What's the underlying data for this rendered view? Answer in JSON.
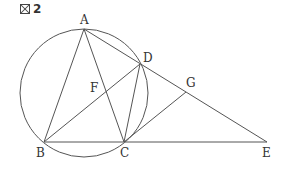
{
  "figure": {
    "title_number": "2",
    "title_icon": "figure-mark-icon"
  },
  "geometry": {
    "circle": {
      "cx": 84,
      "cy": 93,
      "r": 64
    },
    "points": {
      "A": {
        "x": 84,
        "y": 29,
        "label": "A",
        "lx": 80,
        "ly": 24
      },
      "B": {
        "x": 44,
        "y": 142,
        "label": "B",
        "lx": 36,
        "ly": 157
      },
      "C": {
        "x": 124,
        "y": 142,
        "label": "C",
        "lx": 120,
        "ly": 157
      },
      "D": {
        "x": 140,
        "y": 64,
        "label": "D",
        "lx": 143,
        "ly": 62
      },
      "E": {
        "x": 267,
        "y": 142,
        "label": "E",
        "lx": 262,
        "ly": 157
      },
      "F": {
        "x": 102,
        "y": 97,
        "label": "F",
        "lx": 90,
        "ly": 92
      },
      "G": {
        "x": 186,
        "y": 92,
        "label": "G",
        "lx": 186,
        "ly": 87
      }
    },
    "segments": [
      [
        "A",
        "B"
      ],
      [
        "A",
        "C"
      ],
      [
        "A",
        "E"
      ],
      [
        "B",
        "E"
      ],
      [
        "B",
        "D"
      ],
      [
        "C",
        "D"
      ],
      [
        "C",
        "G"
      ]
    ]
  },
  "colors": {
    "line": "#555555",
    "text": "#333333"
  }
}
